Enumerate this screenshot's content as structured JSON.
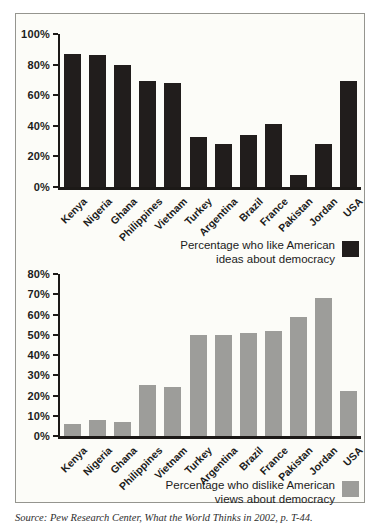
{
  "figure": {
    "source_note": "Source: Pew Research Center, What the World Thinks in 2002, p. T-44."
  },
  "chart_data": [
    {
      "type": "bar",
      "categories": [
        "Kenya",
        "Nigeria",
        "Ghana",
        "Philippines",
        "Vietnam",
        "Turkey",
        "Argentina",
        "Brazil",
        "France",
        "Pakistan",
        "Jordan",
        "USA"
      ],
      "values": [
        87,
        86,
        80,
        69,
        68,
        33,
        28,
        34,
        41,
        8,
        28,
        69
      ],
      "ylim": [
        0,
        100
      ],
      "ytick_step": 20,
      "ytick_labels": [
        "100%",
        "80%",
        "60%",
        "40%",
        "20%",
        "0%"
      ],
      "bar_color": "#211d1c",
      "axis_color": "#1c1917",
      "grid": false,
      "legend_position": "bottom-right",
      "legend_line1": "Percentage who like American",
      "legend_line2": "ideas about democracy"
    },
    {
      "type": "bar",
      "categories": [
        "Kenya",
        "Nigeria",
        "Ghana",
        "Philippines",
        "Vietnam",
        "Turkey",
        "Argentina",
        "Brazil",
        "France",
        "Pakistan",
        "Jordan",
        "USA"
      ],
      "values": [
        6,
        8,
        7,
        25,
        24,
        50,
        50,
        51,
        52,
        59,
        68,
        22
      ],
      "ylim": [
        0,
        80
      ],
      "ytick_step": 10,
      "ytick_labels": [
        "80%",
        "70%",
        "60%",
        "50%",
        "40%",
        "30%",
        "20%",
        "10%",
        "0%"
      ],
      "bar_color": "#9d9d9a",
      "axis_color": "#1c1917",
      "grid": false,
      "legend_position": "bottom-right",
      "legend_line1": "Percentage who dislike American",
      "legend_line2": "views about democracy"
    }
  ]
}
